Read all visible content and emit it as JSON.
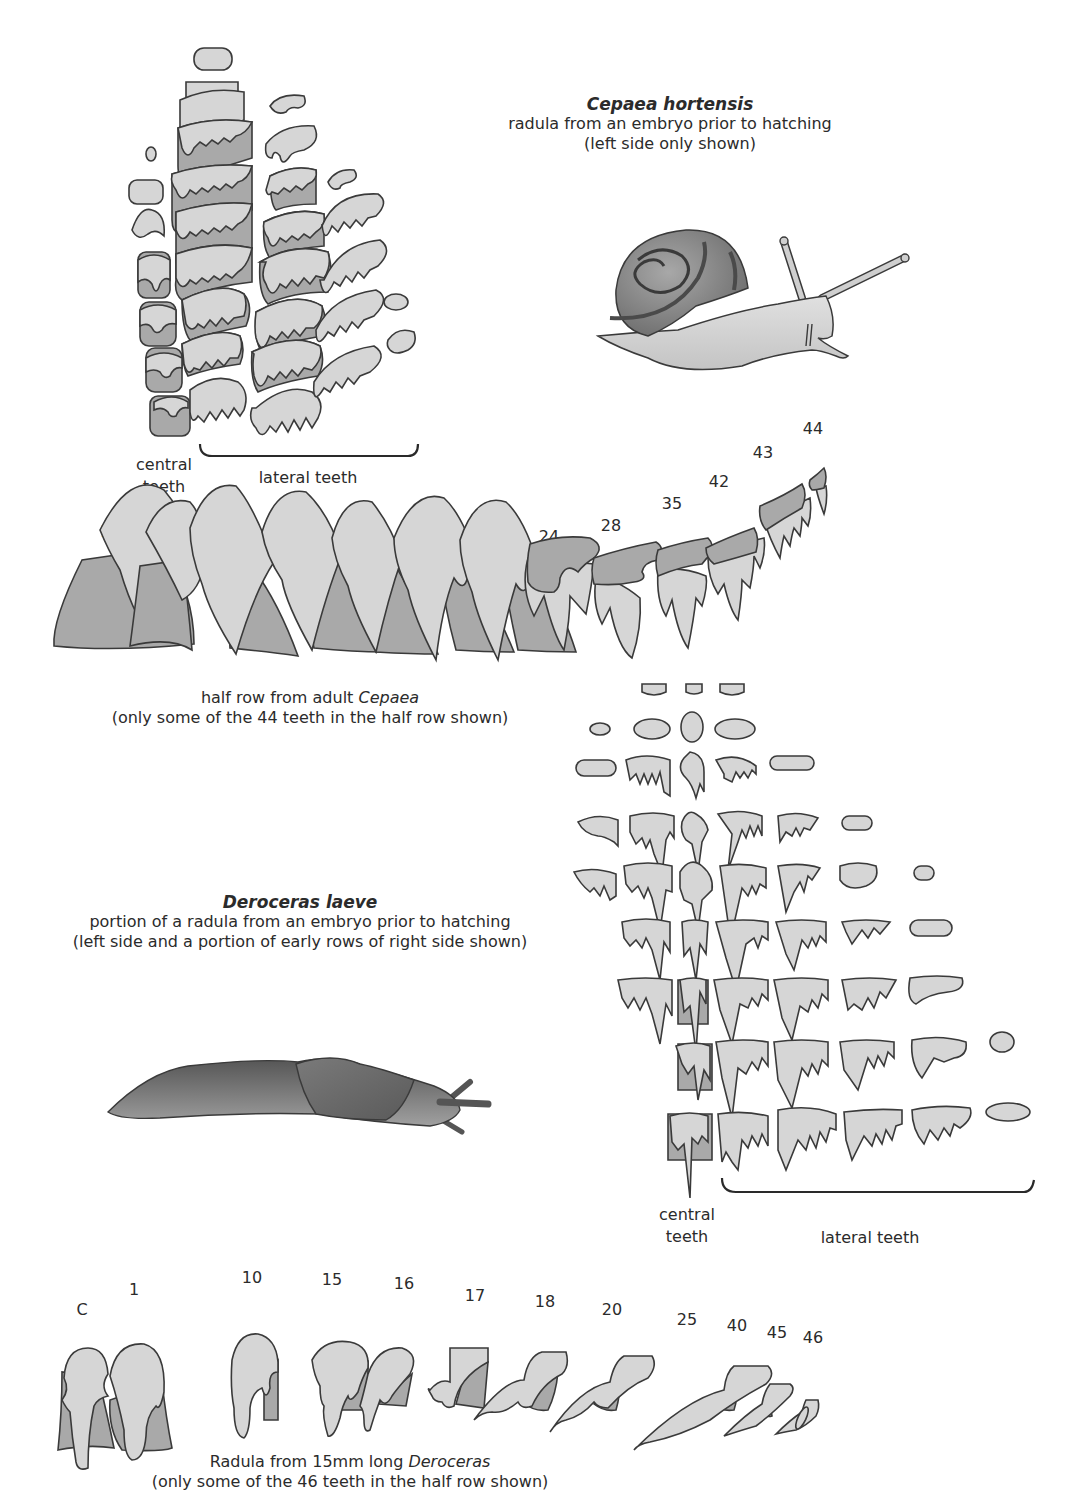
{
  "cepaea": {
    "title": "Cepaea hortensis",
    "subtitle_1": "radula from an embryo prior to hatching",
    "subtitle_2": "(left side only shown)",
    "embryo_labels": {
      "central": "central",
      "central_2": "teeth",
      "lateral": "lateral teeth"
    },
    "adult_row_labels": [
      "1",
      "C",
      "1",
      "6",
      "10",
      "13",
      "15",
      "24",
      "28",
      "35",
      "42",
      "43",
      "44"
    ],
    "adult_caption_1_prefix": "half row from adult ",
    "adult_caption_1_italic": "Cepaea",
    "adult_caption_2": "(only some of the 44 teeth in the half row shown)"
  },
  "deroceras": {
    "title": "Deroceras laeve",
    "subtitle_1": "portion of a radula from an embryo prior to hatching",
    "subtitle_2": "(left side and a portion of early rows of right side shown)",
    "embryo_labels": {
      "central": "central",
      "central_2": "teeth",
      "lateral": "lateral teeth"
    },
    "adult_row_labels": [
      "C",
      "1",
      "10",
      "15",
      "16",
      "17",
      "18",
      "20",
      "25",
      "40",
      "45",
      "46"
    ],
    "adult_caption_1_prefix": "Radula from 15mm long ",
    "adult_caption_1_italic": "Deroceras",
    "adult_caption_2": "(only some of the 46  teeth in the half row shown)"
  },
  "illustrations": {
    "snail": "snail-illustration",
    "slug": "slug-illustration"
  },
  "colors": {
    "tooth_light": "#d6d6d6",
    "tooth_dark": "#a9a9a9",
    "outline": "#3a3a3a",
    "shell": "#8c8c8c",
    "slug_body": "#6e6e6e"
  }
}
